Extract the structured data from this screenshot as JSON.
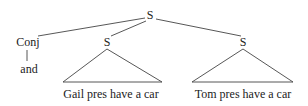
{
  "tree": {
    "root_label": "S",
    "conj_label": "Conj",
    "conj_word": "and",
    "left_s_label": "S",
    "right_s_label": "S",
    "left_clause": "Gail pres have a car",
    "right_clause": "Tom pres have a car"
  }
}
